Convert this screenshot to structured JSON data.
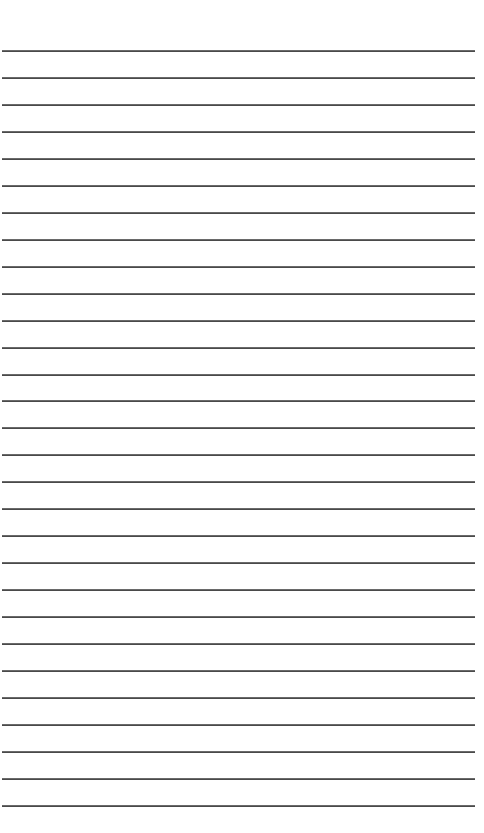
{
  "page": {
    "type": "lined-paper",
    "background": "#ffffff",
    "rule_color": "#4a4a4a",
    "rule_count": 29,
    "first_rule_y": 50,
    "rule_spacing": 26.96,
    "rule_left": 2,
    "rule_width": 473,
    "text": ""
  }
}
